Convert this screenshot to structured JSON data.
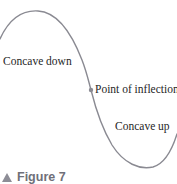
{
  "figure": {
    "title_clipped": "POINT OF INFLECTION",
    "caption_marker": "triangle-marker",
    "caption_text": "Figure 7",
    "background_color": "#ffffff"
  },
  "curve": {
    "name": "cubic-concavity-curve",
    "stroke_color": "#8a8a92",
    "stroke_width": 1.4,
    "path": "M 0,39 C 9,19 22,10 38,11 C 56,12 70,29 82,60 C 87,73 89,83 91,90 C 96,110 103,130 112,145 C 124,164 140,170 153,167 C 164,164 172,150 177,134"
  },
  "inflection_marker": {
    "name": "inflection-point-dot",
    "x": 91,
    "y": 90,
    "radius": 2.2,
    "color": "#8a8a92"
  },
  "labels": {
    "concave_down": "Concave down",
    "point_of_inflection": "Point of inflection",
    "concave_up": "Concave up"
  },
  "text_color": "#262626"
}
